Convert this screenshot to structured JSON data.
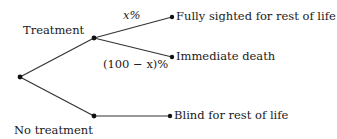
{
  "diagram": {
    "type": "decision-tree",
    "branches": {
      "treatment": "Treatment",
      "no_treatment": "No treatment"
    },
    "probabilities": {
      "success": "x%",
      "failure": "(100 − x)%"
    },
    "outcomes": {
      "fully_sighted": "Fully sighted for rest of life",
      "immediate_death": "Immediate death",
      "blind": "Blind for rest of life"
    },
    "colors": {
      "line": "#333333",
      "node": "#111111",
      "text": "#1a1a1a"
    }
  }
}
